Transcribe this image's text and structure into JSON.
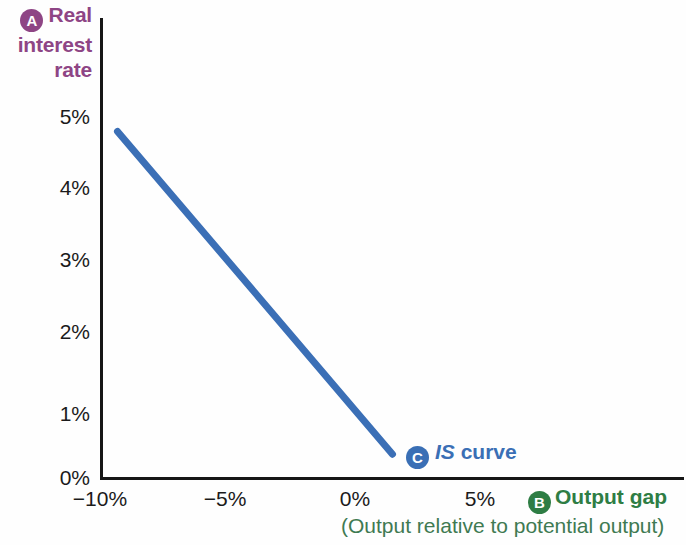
{
  "chart_data": {
    "type": "line",
    "title": "",
    "xlabel": "Output gap",
    "xlabel_sub": "(Output relative to potential output)",
    "ylabel": "Real interest rate",
    "ylabel_lines": [
      "Real",
      "interest",
      "rate"
    ],
    "xlim": [
      -11.5,
      12.0
    ],
    "ylim": [
      0,
      5.4
    ],
    "xticks": [
      "−10%",
      "−5%",
      "0%",
      "5%"
    ],
    "xtick_values": [
      -10,
      -5,
      0,
      5
    ],
    "yticks": [
      "0%",
      "1%",
      "2%",
      "3%",
      "4%",
      "5%"
    ],
    "ytick_values": [
      0,
      1,
      2,
      3,
      4,
      5
    ],
    "grid": false,
    "legend": "inline-annotation",
    "series": [
      {
        "name": "IS curve",
        "color": "#3b6fb6",
        "x": [
          -9.3,
          1.7
        ],
        "y": [
          4.8,
          0.33
        ]
      }
    ],
    "annotations": [
      {
        "badge": "A",
        "text": "Real interest rate",
        "color": "#8e4585",
        "position": "y-axis-title"
      },
      {
        "badge": "B",
        "text": "Output gap",
        "color": "#2e7d44",
        "position": "x-axis-title"
      },
      {
        "badge": "C",
        "text": "IS curve",
        "color": "#3a6fb5",
        "position": "curve-end"
      }
    ]
  },
  "axis": {
    "y_title_badge": "A",
    "x_title_badge": "B",
    "curve_badge": "C"
  },
  "curve": {
    "label_italic": "IS",
    "label_rest": "curve"
  }
}
